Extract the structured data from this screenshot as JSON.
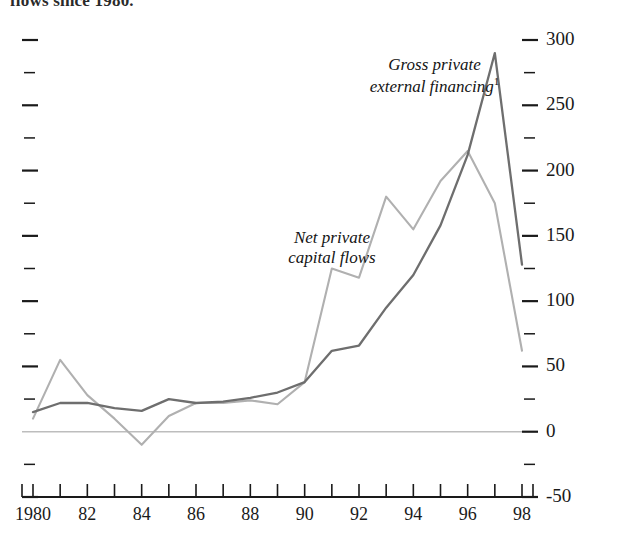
{
  "caption_fragment": "flows since 1980.",
  "chart_data": {
    "type": "line",
    "title": "",
    "subtitle": "",
    "xlabel": "",
    "ylabel": "",
    "x": [
      1980,
      1981,
      1982,
      1983,
      1984,
      1985,
      1986,
      1987,
      1988,
      1989,
      1990,
      1991,
      1992,
      1993,
      1994,
      1995,
      1996,
      1997,
      1998
    ],
    "xlim": [
      1980,
      1998
    ],
    "ylim": [
      -50,
      300
    ],
    "y_ticks_major": [
      -50,
      0,
      50,
      100,
      150,
      200,
      250,
      300
    ],
    "y_ticks_minor": [
      -25,
      25,
      75,
      125,
      175,
      225,
      275
    ],
    "y_tick_labels": [
      "-50",
      "0",
      "50",
      "100",
      "150",
      "200",
      "250",
      "300"
    ],
    "x_tick_labels": [
      "1980",
      "82",
      "84",
      "86",
      "88",
      "90",
      "92",
      "94",
      "96",
      "98"
    ],
    "x_tick_label_values": [
      1980,
      1982,
      1984,
      1986,
      1988,
      1990,
      1992,
      1994,
      1996,
      1998
    ],
    "grid": false,
    "zero_line": true,
    "legend_position": "inline-annotation",
    "series": [
      {
        "name": "Gross private external financing",
        "footnote_marker": "1",
        "color": "#6e6e6e",
        "annotation_lines": [
          "Gross private",
          "external financing"
        ],
        "values": [
          15,
          22,
          22,
          18,
          16,
          25,
          22,
          23,
          26,
          30,
          38,
          62,
          66,
          95,
          120,
          158,
          212,
          290,
          128
        ]
      },
      {
        "name": "Net private capital flows",
        "footnote_marker": "",
        "color": "#b0b0b0",
        "annotation_lines": [
          "Net private",
          "capital flows"
        ],
        "values": [
          10,
          55,
          28,
          10,
          -10,
          12,
          22,
          22,
          24,
          21,
          38,
          125,
          118,
          180,
          155,
          192,
          215,
          175,
          62
        ]
      }
    ]
  }
}
